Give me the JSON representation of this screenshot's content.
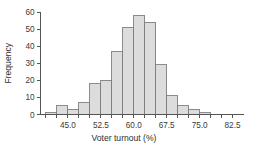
{
  "chart_data": {
    "type": "bar",
    "title": "",
    "subtitle": "",
    "xlabel": "Voter turnout (%)",
    "ylabel": "Frequency",
    "xlim": [
      38.75,
      85.0
    ],
    "ylim": [
      0,
      60
    ],
    "grid": false,
    "legend": null,
    "bin_width": 2.5,
    "xticks": [
      "45.0",
      "52.5",
      "60.0",
      "67.5",
      "75.0",
      "82.5"
    ],
    "xtick_values": [
      45.0,
      52.5,
      60.0,
      67.5,
      75.0,
      82.5
    ],
    "yticks": [
      "0",
      "10",
      "20",
      "30",
      "40",
      "50",
      "60"
    ],
    "ytick_values": [
      0,
      10,
      20,
      30,
      40,
      50,
      60
    ],
    "bins": [
      {
        "left": 40.0,
        "right": 42.5,
        "center": 41.25,
        "value": 1
      },
      {
        "left": 42.5,
        "right": 45.0,
        "center": 43.75,
        "value": 5
      },
      {
        "left": 45.0,
        "right": 47.5,
        "center": 46.25,
        "value": 3
      },
      {
        "left": 47.5,
        "right": 50.0,
        "center": 48.75,
        "value": 7
      },
      {
        "left": 50.0,
        "right": 52.5,
        "center": 51.25,
        "value": 18
      },
      {
        "left": 52.5,
        "right": 55.0,
        "center": 53.75,
        "value": 20
      },
      {
        "left": 55.0,
        "right": 57.5,
        "center": 56.25,
        "value": 37
      },
      {
        "left": 57.5,
        "right": 60.0,
        "center": 58.75,
        "value": 51
      },
      {
        "left": 60.0,
        "right": 62.5,
        "center": 61.25,
        "value": 58
      },
      {
        "left": 62.5,
        "right": 65.0,
        "center": 63.75,
        "value": 54
      },
      {
        "left": 65.0,
        "right": 67.5,
        "center": 66.25,
        "value": 29
      },
      {
        "left": 67.5,
        "right": 70.0,
        "center": 68.75,
        "value": 11
      },
      {
        "left": 70.0,
        "right": 72.5,
        "center": 71.25,
        "value": 5
      },
      {
        "left": 72.5,
        "right": 75.0,
        "center": 73.75,
        "value": 3
      },
      {
        "left": 75.0,
        "right": 77.5,
        "center": 76.25,
        "value": 1
      }
    ],
    "categories": [
      "41.25",
      "43.75",
      "46.25",
      "48.75",
      "51.25",
      "53.75",
      "56.25",
      "58.75",
      "61.25",
      "63.75",
      "66.25",
      "68.75",
      "71.25",
      "73.75",
      "76.25"
    ],
    "values": [
      1,
      5,
      3,
      7,
      18,
      20,
      37,
      51,
      58,
      54,
      29,
      11,
      5,
      3,
      1
    ],
    "colors": {
      "bar_fill": "#dcdcdc",
      "bar_stroke": "#808080",
      "axis": "#555555",
      "text": "#333333",
      "background": "#ffffff"
    }
  }
}
